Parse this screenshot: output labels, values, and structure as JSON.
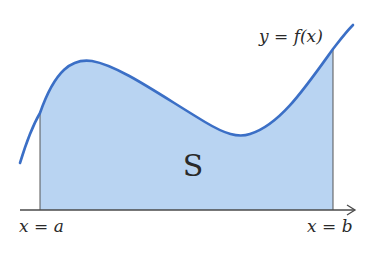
{
  "diagram": {
    "region_label": "S",
    "curve_label": "y = f(x)",
    "left_bound_label": "x = a",
    "right_bound_label": "x = b",
    "colors": {
      "curve": "#3b6fc6",
      "fill": "#b9d4f2",
      "axis": "#4a4a4a",
      "text": "#2a2a2a"
    }
  }
}
